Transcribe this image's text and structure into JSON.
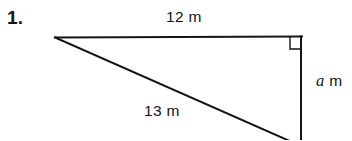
{
  "problem": {
    "number": "1.",
    "figure_type": "right-triangle"
  },
  "labels": {
    "top_side": "12 m",
    "hypotenuse": "13 m",
    "vertical_side_variable": "a",
    "vertical_side_unit": "m",
    "vertical_side_full": "a m"
  },
  "figure": {
    "stroke_color": "#141414",
    "background_color": "#ffffff",
    "stroke_width": 2,
    "right_angle_marker": "right-angle-square",
    "vertices": {
      "left": [
        55,
        37
      ],
      "top_right": [
        301,
        37
      ],
      "bottom_right": [
        301,
        146
      ]
    }
  },
  "colors": {
    "ink": "#141414",
    "page": "#ffffff"
  }
}
